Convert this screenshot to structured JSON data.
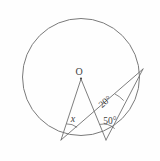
{
  "figure": {
    "background_color": "#fefefe",
    "stroke_color": "#6f6f6f",
    "label_color": "#3d3d3d"
  },
  "labels": {
    "center": "O",
    "unknown_angle": "x",
    "inscribed_angle": "20°",
    "base_angle": "50°"
  },
  "geometry": {
    "circle": {
      "cx": 81,
      "cy": 77,
      "r": 59
    },
    "points": {
      "O": {
        "x": 81,
        "y": 77,
        "name": "center"
      },
      "A": {
        "x": 61,
        "y": 140,
        "name": "lower-left-point"
      },
      "B": {
        "x": 106,
        "y": 140,
        "name": "lower-right-point"
      },
      "C": {
        "x": 143,
        "y": 69,
        "name": "right-point"
      }
    },
    "segments": [
      {
        "from": "O",
        "to": "A",
        "name": "radius-OA"
      },
      {
        "from": "O",
        "to": "B",
        "name": "radius-OB"
      },
      {
        "from": "A",
        "to": "C",
        "name": "chord-AC"
      },
      {
        "from": "B",
        "to": "C",
        "name": "chord-BC"
      }
    ],
    "angle_marks": [
      {
        "vertex": "A",
        "label": "x",
        "name": "angle-x-arc"
      },
      {
        "vertex": "B",
        "label": "50°",
        "name": "angle-50-arc"
      },
      {
        "vertex": "C",
        "label": "20°",
        "name": "angle-20-arc"
      }
    ]
  },
  "label_positions": {
    "O": {
      "x": 79,
      "y": 75
    },
    "x": {
      "x": 73,
      "y": 122
    },
    "a20": {
      "x": 107,
      "y": 104
    },
    "a50": {
      "x": 101,
      "y": 127
    }
  }
}
